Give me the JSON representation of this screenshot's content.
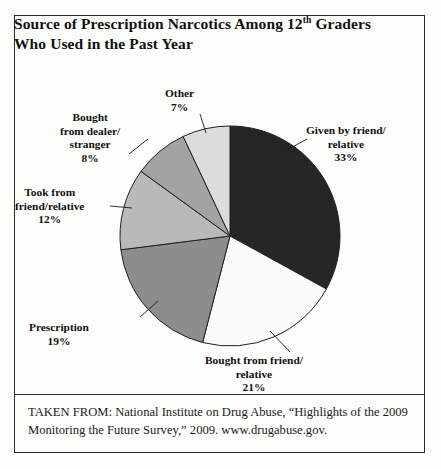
{
  "figure": {
    "title_line1_pre": "Source of Prescription Narcotics Among 12",
    "title_sup": "th",
    "title_line1_post": " Graders",
    "title_line2": "Who Used in the Past Year",
    "source_note": "TAKEN FROM: National Institute on Drug Abuse, “Highlights of the 2009 Monitoring the Future Survey,” 2009. www.drugabuse.gov."
  },
  "chart_data": {
    "type": "pie",
    "title": "Source of Prescription Narcotics Among 12th Graders Who Used in the Past Year",
    "xlabel": "",
    "ylabel": "",
    "legend": "none (direct callout labels)",
    "grid": false,
    "units": "percent",
    "start_angle_deg": 0,
    "direction": "clockwise",
    "categories": [
      "Given by friend/relative",
      "Bought from friend/relative",
      "Prescription",
      "Took from friend/relative",
      "Bought from dealer/stranger",
      "Other"
    ],
    "values": [
      33,
      21,
      19,
      12,
      8,
      7
    ],
    "colors": [
      "#262626",
      "#fbfbfa",
      "#8d8d8d",
      "#b9b9b9",
      "#a3a3a3",
      "#dcdcdc"
    ],
    "slices": [
      {
        "id": "given-by-friend-relative",
        "label_line1": "Given by friend/",
        "label_line2": "relative",
        "percent_text": "33%",
        "value": 33,
        "color": "#262626"
      },
      {
        "id": "bought-from-friend-relative",
        "label_line1": "Bought from friend/",
        "label_line2": "relative",
        "percent_text": "21%",
        "value": 21,
        "color": "#fbfbfa"
      },
      {
        "id": "prescription",
        "label_line1": "Prescription",
        "label_line2": "",
        "percent_text": "19%",
        "value": 19,
        "color": "#8d8d8d"
      },
      {
        "id": "took-from-friend-relative",
        "label_line1": "Took from",
        "label_line2": "friend/relative",
        "percent_text": "12%",
        "value": 12,
        "color": "#b9b9b9"
      },
      {
        "id": "bought-from-dealer-stranger",
        "label_line1": "Bought",
        "label_line2": "from dealer/",
        "label_line3": "stranger",
        "percent_text": "8%",
        "value": 8,
        "color": "#a3a3a3"
      },
      {
        "id": "other",
        "label_line1": "Other",
        "label_line2": "",
        "percent_text": "7%",
        "value": 7,
        "color": "#dcdcdc"
      }
    ]
  }
}
